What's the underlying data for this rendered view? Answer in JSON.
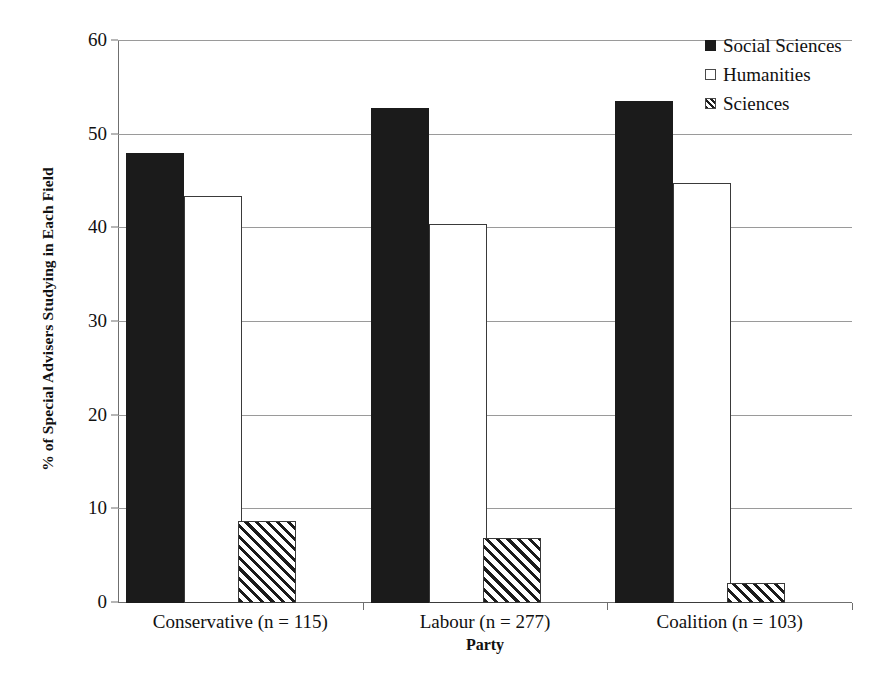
{
  "chart_data": {
    "type": "bar",
    "title": "",
    "xlabel": "Party",
    "ylabel": "% of Special Advisers Studying in Each Field",
    "categories": [
      "Conservative (n = 115)",
      "Labour (n = 277)",
      "Coalition (n = 103)"
    ],
    "series": [
      {
        "name": "Social Sciences",
        "values": [
          48.0,
          52.8,
          53.6
        ],
        "style": "solid-black"
      },
      {
        "name": "Humanities",
        "values": [
          43.5,
          40.5,
          44.8
        ],
        "style": "white-outline"
      },
      {
        "name": "Sciences",
        "values": [
          8.8,
          6.9,
          2.1
        ],
        "style": "diagonal-hatch"
      }
    ],
    "ylim": [
      0,
      60
    ],
    "ytick_labels": [
      "0",
      "10",
      "20",
      "30",
      "40",
      "50",
      "60"
    ],
    "ytick_values": [
      0,
      10,
      20,
      30,
      40,
      50,
      60
    ],
    "grid": true,
    "legend_position": "top-right",
    "colors": {
      "social_sciences": "#1b1b1b",
      "humanities": "#ffffff",
      "sciences_hatch": "#1b1b1b",
      "gridline": "#9a9a9a",
      "axis": "#6f6f6f",
      "text": "#111111"
    }
  },
  "legend": {
    "items": [
      {
        "label": "Social Sciences"
      },
      {
        "label": "Humanities"
      },
      {
        "label": "Sciences"
      }
    ]
  }
}
